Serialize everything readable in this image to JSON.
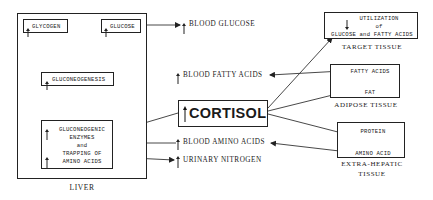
{
  "diagram": {
    "hormone": {
      "label": "CORTISOL",
      "direction": "up"
    },
    "liver": {
      "label": "LIVER",
      "glycogen": {
        "label": "GLYCOGEN",
        "direction": "up"
      },
      "glucose": {
        "label": "GLUCOSE",
        "direction": "up"
      },
      "gluconeogenesis": {
        "label": "GLUCONEOGENESIS",
        "direction": "up"
      },
      "enzymes": {
        "line1": "GLUCONEOGENIC",
        "line2": "ENZYMES",
        "line3": "and",
        "line4": "TRAPPING OF",
        "line5": "AMINO ACIDS",
        "directions": [
          "up",
          "up"
        ]
      }
    },
    "blood": {
      "glucose": {
        "label": "BLOOD GLUCOSE",
        "direction": "up"
      },
      "fatty_acids": {
        "label": "BLOOD FATTY ACIDS",
        "direction": "up"
      },
      "amino_acids": {
        "label": "BLOOD AMINO ACIDS",
        "direction": "up"
      },
      "urinary_nitrogen": {
        "label": "URINARY NITROGEN",
        "direction": "up"
      }
    },
    "target_tissue": {
      "label": "TARGET TISSUE",
      "line1": "UTILIZATION",
      "line2": "of",
      "line3": "GLUCOSE and FATTY ACIDS",
      "direction": "down"
    },
    "adipose_tissue": {
      "label": "ADIPOSE TISSUE",
      "top": "FATTY ACIDS",
      "bottom": "FAT"
    },
    "extra_hepatic_tissue": {
      "label_line1": "EXTRA-HEPATIC",
      "label_line2": "TISSUE",
      "top": "PROTEIN",
      "bottom": "AMINO ACID"
    }
  }
}
